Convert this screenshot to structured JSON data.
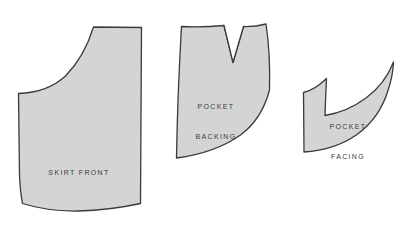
{
  "document": {
    "type": "sewing-pattern-diagram",
    "background_color": "#ffffff",
    "piece_fill_color": "#d3d4d4",
    "piece_stroke_color": "#3a3a3c",
    "label_text_color": "#3a3a3c"
  },
  "pieces": [
    {
      "id": "skirt-front",
      "name": "Skirt Front",
      "label_lines": [
        "SKIRT FRONT"
      ],
      "label_x": 79,
      "label_y": 148,
      "outline_path": "M 18.5 93.5 L 19.5 175 Q 20.2 192 22.5 203.5 Q 48 211.5 78 211 Q 110 210.2 140.5 203.5 L 141.5 27.5 L 93.5 27 Q 84.5 56.5 65.5 76 Q 47.5 92.5 18.5 93.5 Z",
      "shade_tone": "#d3d4d4"
    },
    {
      "id": "pocket-backing",
      "name": "Pocket Backing",
      "label_lines": [
        "POCKET",
        "BACKING"
      ],
      "label_x": 216,
      "label_y": 82,
      "outline_path": "M 181.5 26.5 Q 177.5 95 176.5 158 Q 215 153 240.5 135 Q 262 119 269.5 90 Q 270.5 54 266 24 Q 254.5 27 243.5 26.5 L 233 62.5 L 224 25.5 Q 202 27.5 181.5 26.5 Z",
      "shade_tone": "#d3d4d4",
      "dart": {
        "id": "pocket-backing-dart",
        "name": "V Dart Notch",
        "path": "M 224 25.5 L 233 62.5 L 243.5 26.5"
      }
    },
    {
      "id": "pocket-facing",
      "name": "Pocket Facing",
      "label_lines": [
        "POCKET",
        "FACING"
      ],
      "label_x": 348,
      "label_y": 102,
      "outline_path": "M 303.5 92.5 L 304 152 Q 335 150 357 134.5 Q 379 118.5 387.5 92 Q 393 76 393.5 62 Q 385 84 366 98 Q 347 112 325 115.5 Q 325.5 100 326.5 78.5 Q 315.5 89.5 303.5 92.5 Z",
      "shade_tone": "#d3d4d4"
    }
  ]
}
